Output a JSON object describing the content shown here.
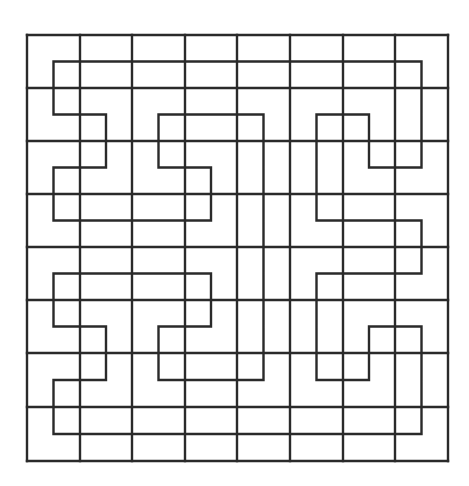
{
  "diagram": {
    "title": "",
    "type": "grid-with-space-filling-path",
    "grid": {
      "rows": 8,
      "cols": 8,
      "x_lines": [
        27,
        80,
        132,
        185,
        237,
        290,
        343,
        395,
        448
      ],
      "y_lines": [
        35,
        88,
        141,
        194,
        247,
        300,
        353,
        407,
        461
      ],
      "stroke": "#2a2a2a",
      "stroke_width": 2.4
    },
    "path": {
      "description": "Closed Hilbert-like loop through the centers of all 64 cells",
      "stroke": "#2a2a2a",
      "stroke_width": 2.4,
      "cells": [
        [
          0,
          0
        ],
        [
          0,
          1
        ],
        [
          0,
          2
        ],
        [
          0,
          3
        ],
        [
          0,
          4
        ],
        [
          0,
          5
        ],
        [
          0,
          6
        ],
        [
          0,
          7
        ],
        [
          1,
          7
        ],
        [
          2,
          7
        ],
        [
          2,
          6
        ],
        [
          1,
          6
        ],
        [
          1,
          5
        ],
        [
          2,
          5
        ],
        [
          3,
          5
        ],
        [
          3,
          6
        ],
        [
          3,
          7
        ],
        [
          4,
          7
        ],
        [
          4,
          6
        ],
        [
          4,
          5
        ],
        [
          5,
          5
        ],
        [
          6,
          5
        ],
        [
          6,
          6
        ],
        [
          5,
          6
        ],
        [
          5,
          7
        ],
        [
          6,
          7
        ],
        [
          7,
          7
        ],
        [
          7,
          6
        ],
        [
          7,
          5
        ],
        [
          7,
          4
        ],
        [
          7,
          3
        ],
        [
          7,
          2
        ],
        [
          7,
          1
        ],
        [
          7,
          0
        ],
        [
          6,
          0
        ],
        [
          6,
          1
        ],
        [
          5,
          1
        ],
        [
          5,
          0
        ],
        [
          4,
          0
        ],
        [
          4,
          1
        ],
        [
          4,
          2
        ],
        [
          4,
          3
        ],
        [
          5,
          3
        ],
        [
          5,
          2
        ],
        [
          6,
          2
        ],
        [
          6,
          3
        ],
        [
          6,
          4
        ],
        [
          5,
          4
        ],
        [
          4,
          4
        ],
        [
          3,
          4
        ],
        [
          2,
          4
        ],
        [
          1,
          4
        ],
        [
          1,
          3
        ],
        [
          1,
          2
        ],
        [
          2,
          2
        ],
        [
          2,
          3
        ],
        [
          3,
          3
        ],
        [
          3,
          2
        ],
        [
          3,
          1
        ],
        [
          3,
          0
        ],
        [
          2,
          0
        ],
        [
          2,
          1
        ],
        [
          1,
          1
        ],
        [
          1,
          0
        ]
      ],
      "closed": true
    }
  }
}
